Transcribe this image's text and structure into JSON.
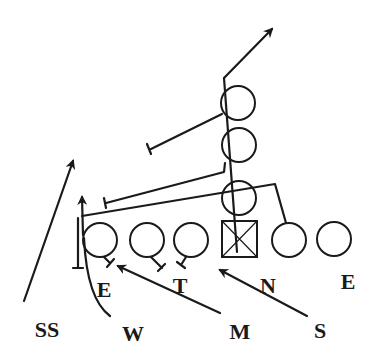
{
  "diagram": {
    "type": "football-play",
    "colors": {
      "ink": "#1a1a1a",
      "background": "#ffffff"
    },
    "offense": {
      "backs": [
        {
          "id": "back-1",
          "cx": 238,
          "cy": 103,
          "r": 17
        },
        {
          "id": "back-2",
          "cx": 239,
          "cy": 145,
          "r": 17
        },
        {
          "id": "back-3",
          "cx": 239,
          "cy": 198,
          "r": 17
        }
      ],
      "center": {
        "x": 222,
        "y": 221,
        "w": 35,
        "h": 36
      },
      "line": [
        {
          "id": "lt",
          "cx": 100,
          "cy": 240,
          "r": 17
        },
        {
          "id": "lg",
          "cx": 147,
          "cy": 240,
          "r": 17
        },
        {
          "id": "lg2",
          "cx": 191,
          "cy": 240,
          "r": 17
        },
        {
          "id": "rg",
          "cx": 289,
          "cy": 240,
          "r": 17
        },
        {
          "id": "rt",
          "cx": 334,
          "cy": 239,
          "r": 17
        }
      ]
    },
    "defense_labels": [
      {
        "id": "E-left",
        "text": "E",
        "x": 104,
        "y": 297,
        "size": 22
      },
      {
        "id": "T",
        "text": "T",
        "x": 180,
        "y": 293,
        "size": 22
      },
      {
        "id": "N",
        "text": "N",
        "x": 268,
        "y": 293,
        "size": 22
      },
      {
        "id": "E-right",
        "text": "E",
        "x": 348,
        "y": 289,
        "size": 22
      },
      {
        "id": "SS",
        "text": "SS",
        "x": 47,
        "y": 337,
        "size": 22
      },
      {
        "id": "W",
        "text": "W",
        "x": 133,
        "y": 341,
        "size": 22
      },
      {
        "id": "M",
        "text": "M",
        "x": 240,
        "y": 339,
        "size": 22
      },
      {
        "id": "S",
        "text": "S",
        "x": 320,
        "y": 338,
        "size": 22
      }
    ]
  }
}
